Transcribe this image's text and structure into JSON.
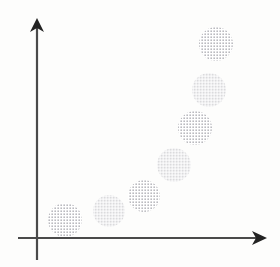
{
  "figure": {
    "title": "",
    "subtitle": "",
    "background_color": "#fdfdfc",
    "alt_text": "Schematic scatter diagram: seven dotted circular blobs rising from lower left to upper right along a convex increasing curve, drawn on arrow-tipped x and y axes with no tick labels."
  },
  "axes": {
    "color": "#4a4a4a",
    "line_width": 2.2,
    "x_axis": {
      "label": "",
      "tick_labels": [],
      "grid": false,
      "start_x": 18,
      "end_x": 267,
      "y": 238,
      "arrow": "right-arrow-head"
    },
    "y_axis": {
      "label": "",
      "tick_labels": [],
      "grid": false,
      "x": 37,
      "start_y": 260,
      "end_y": 18,
      "arrow": "up-arrow-head"
    },
    "origin": {
      "x": 37,
      "y": 238
    }
  },
  "chart_data": {
    "type": "scatter",
    "title": "",
    "subtitle": "",
    "xlabel": "",
    "ylabel": "",
    "xlim": [
      0,
      10
    ],
    "ylim": [
      0,
      10
    ],
    "grid": false,
    "legend": null,
    "legend_position": "none",
    "marker_style": {
      "shape": "circle",
      "fill": "halftone-dot-pattern",
      "dot_color": "#5a5a66",
      "dot_spacing_px": 3,
      "dot_radius_px": 0.62,
      "edge": "none"
    },
    "annotations": [],
    "note": "Marker sizes are roughly uniform; positions trace a convex, monotonically increasing trend.",
    "categories": [
      "p1",
      "p2",
      "p3",
      "p4",
      "p5",
      "p6",
      "p7"
    ],
    "x": [
      1.13,
      2.89,
      4.29,
      5.49,
      6.33,
      6.89,
      7.17
    ],
    "y": [
      0.75,
      1.13,
      1.76,
      3.05,
      4.59,
      6.17,
      8.09
    ],
    "points": [
      {
        "name": "p1",
        "x": 1.13,
        "y": 0.75,
        "cx": 65,
        "cy": 220,
        "r": 17
      },
      {
        "name": "p2",
        "x": 2.89,
        "y": 1.13,
        "cx": 109,
        "cy": 211,
        "r": 16
      },
      {
        "name": "p3",
        "x": 4.29,
        "y": 1.76,
        "cx": 144,
        "cy": 196,
        "r": 16
      },
      {
        "name": "p4",
        "x": 5.49,
        "y": 3.05,
        "cx": 174,
        "cy": 165,
        "r": 17
      },
      {
        "name": "p5",
        "x": 6.33,
        "y": 4.59,
        "cx": 195,
        "cy": 128,
        "r": 17
      },
      {
        "name": "p6",
        "x": 6.89,
        "y": 6.17,
        "cx": 209,
        "cy": 90,
        "r": 17
      },
      {
        "name": "p7",
        "x": 7.17,
        "y": 8.09,
        "cx": 216,
        "cy": 44,
        "r": 17
      }
    ]
  }
}
